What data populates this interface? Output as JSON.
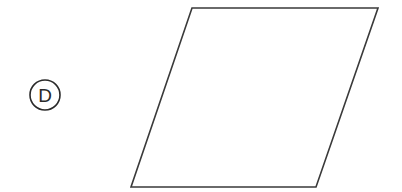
{
  "option": {
    "label": "D",
    "circle": {
      "cx": 45,
      "cy": 95,
      "r": 15
    }
  },
  "shape": {
    "type": "parallelogram",
    "points": "192,8 378,8 316,187 131,187",
    "stroke": "#3a3a3a",
    "stroke_width": 1.6,
    "fill": "none"
  },
  "colors": {
    "background": "#ffffff",
    "ink": "#2a2a2a"
  }
}
